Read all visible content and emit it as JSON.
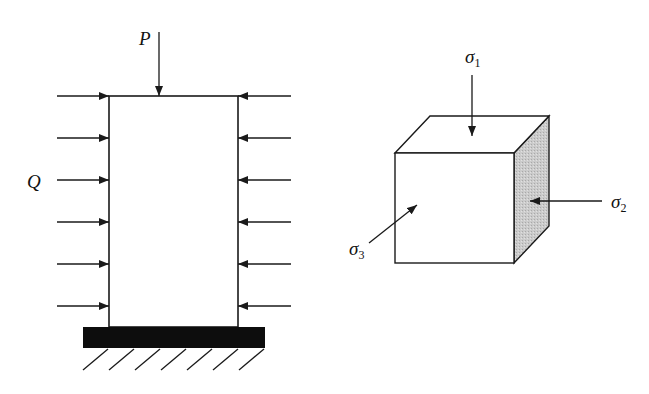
{
  "left_figure": {
    "load_top_label": "P",
    "load_side_label": "Q",
    "side_arrow_count": 6,
    "support": "fixed ground"
  },
  "right_figure": {
    "sigma1": {
      "symbol": "σ",
      "subscript": "1"
    },
    "sigma2": {
      "symbol": "σ",
      "subscript": "2"
    },
    "sigma3": {
      "symbol": "σ",
      "subscript": "3"
    }
  },
  "colors": {
    "line": "#1a1a1a",
    "ground": "#0d0d0d",
    "shaded_face": "#c8c8c8"
  }
}
